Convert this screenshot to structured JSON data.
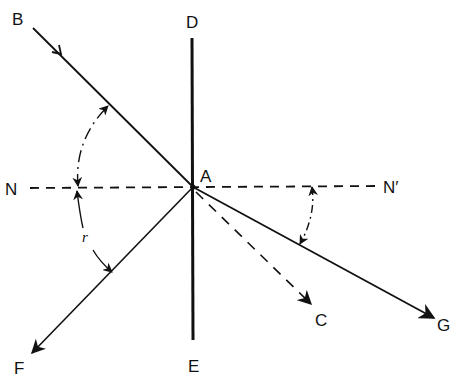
{
  "diagram": {
    "type": "ray-reflection-refraction",
    "colors": {
      "stroke": "#111111",
      "background": "#ffffff"
    },
    "points": {
      "A": {
        "label": "A",
        "x": 193,
        "y": 187
      },
      "B": {
        "label": "B",
        "x": 33,
        "y": 28
      },
      "C": {
        "label": "C",
        "x": 312,
        "y": 305
      },
      "D": {
        "label": "D",
        "x": 192,
        "y": 38
      },
      "E": {
        "label": "E",
        "x": 193,
        "y": 340
      },
      "F": {
        "label": "F",
        "x": 30,
        "y": 355
      },
      "G": {
        "label": "G",
        "x": 435,
        "y": 318
      },
      "N": {
        "label": "N",
        "x": 28,
        "y": 188
      },
      "N_prime": {
        "label": "N′",
        "x": 380,
        "y": 185
      }
    },
    "lines": [
      {
        "id": "BA",
        "from": "B",
        "to": "A",
        "style": "solid",
        "arrow": "mid",
        "meaning": "incident ray"
      },
      {
        "id": "DE",
        "from": "D",
        "to": "E",
        "style": "solid-thick",
        "meaning": "surface / mirror"
      },
      {
        "id": "AF",
        "from": "A",
        "to": "F",
        "style": "solid",
        "arrow": "end",
        "meaning": "reflected ray"
      },
      {
        "id": "AG",
        "from": "A",
        "to": "G",
        "style": "solid",
        "arrow": "end",
        "meaning": "refracted ray"
      },
      {
        "id": "AC",
        "from": "A",
        "to": "C",
        "style": "dashed",
        "arrow": "end",
        "meaning": "extension of incident ray"
      },
      {
        "id": "NN'",
        "from": "N",
        "to": "N_prime",
        "style": "dashed",
        "meaning": "normal"
      }
    ],
    "angles": [
      {
        "label": "i",
        "between": [
          "NA",
          "BA"
        ],
        "side": "left-upper"
      },
      {
        "label": "r",
        "between": [
          "NA",
          "AF"
        ],
        "side": "left-lower"
      },
      {
        "label": "i",
        "between": [
          "AN'",
          "AG"
        ],
        "side": "right-lower"
      }
    ]
  }
}
